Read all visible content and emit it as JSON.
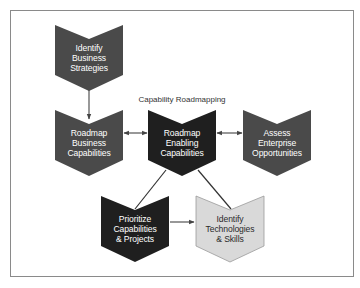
{
  "diagram": {
    "title": "Capability Roadmapping",
    "colors": {
      "medium": "#4a4a4a",
      "dark": "#1f1f1f",
      "light": "#d9d9d9",
      "light_border": "#9a9a9a",
      "connector": "#444444",
      "frame": "#8a8a8a"
    },
    "nodes": [
      {
        "id": "identify-business-strategies",
        "lines": [
          "Identify",
          "Business",
          "Strategies"
        ],
        "shade": "medium"
      },
      {
        "id": "roadmap-business-capabilities",
        "lines": [
          "Roadmap",
          "Business",
          "Capabilities"
        ],
        "shade": "medium"
      },
      {
        "id": "roadmap-enabling-capabilities",
        "lines": [
          "Roadmap",
          "Enabling",
          "Capabilities"
        ],
        "shade": "dark"
      },
      {
        "id": "assess-enterprise-opportunities",
        "lines": [
          "Assess",
          "Enterprise",
          "Opportunities"
        ],
        "shade": "medium"
      },
      {
        "id": "prioritize-capabilities-projects",
        "lines": [
          "Prioritize",
          "Capabilities",
          "& Projects"
        ],
        "shade": "dark"
      },
      {
        "id": "identify-technologies-skills",
        "lines": [
          "Identify",
          "Technologies",
          "& Skills"
        ],
        "shade": "light"
      }
    ],
    "edges": [
      {
        "from": "identify-business-strategies",
        "to": "roadmap-business-capabilities",
        "type": "arrow"
      },
      {
        "from": "roadmap-business-capabilities",
        "to": "roadmap-enabling-capabilities",
        "type": "bidirectional"
      },
      {
        "from": "roadmap-enabling-capabilities",
        "to": "assess-enterprise-opportunities",
        "type": "bidirectional"
      },
      {
        "from": "roadmap-enabling-capabilities",
        "to": "prioritize-capabilities-projects",
        "type": "line"
      },
      {
        "from": "roadmap-enabling-capabilities",
        "to": "identify-technologies-skills",
        "type": "line"
      },
      {
        "from": "prioritize-capabilities-projects",
        "to": "identify-technologies-skills",
        "type": "arrow"
      }
    ]
  }
}
